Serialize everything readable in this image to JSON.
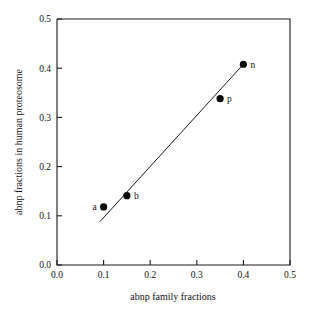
{
  "chart_data": {
    "type": "scatter",
    "title": "",
    "xlabel": "abnp family fractions",
    "ylabel": "abnp fractions in human proteosome",
    "xlim": [
      0.0,
      0.5
    ],
    "ylim": [
      0.0,
      0.5
    ],
    "grid": false,
    "legend": "none",
    "xticks": [
      "0.0",
      "0.1",
      "0.2",
      "0.3",
      "0.4",
      "0.5"
    ],
    "xtick_values": [
      0.0,
      0.1,
      0.2,
      0.3,
      0.4,
      0.5
    ],
    "yticks": [
      "0.0",
      "0.1",
      "0.2",
      "0.3",
      "0.4",
      "0.5"
    ],
    "ytick_values": [
      0.0,
      0.1,
      0.2,
      0.3,
      0.4,
      0.5
    ],
    "points": [
      {
        "label": "a",
        "x": 0.1,
        "y": 0.118,
        "label_side": "left"
      },
      {
        "label": "b",
        "x": 0.15,
        "y": 0.141,
        "label_side": "right"
      },
      {
        "label": "p",
        "x": 0.35,
        "y": 0.338,
        "label_side": "right"
      },
      {
        "label": "n",
        "x": 0.4,
        "y": 0.408,
        "label_side": "right"
      }
    ],
    "series": [
      {
        "name": "abnp fractions",
        "x": [
          0.1,
          0.15,
          0.35,
          0.4
        ],
        "values": [
          0.118,
          0.141,
          0.338,
          0.408
        ]
      }
    ],
    "fit_line": {
      "name": "trend-line",
      "x_start": 0.092,
      "y_start": 0.088,
      "x_end": 0.4,
      "y_end": 0.408
    },
    "colors": {
      "axis": "#1a1a1a",
      "marker": "#0a0a0a",
      "line": "#1a1a1a",
      "background": "#ffffff"
    }
  }
}
